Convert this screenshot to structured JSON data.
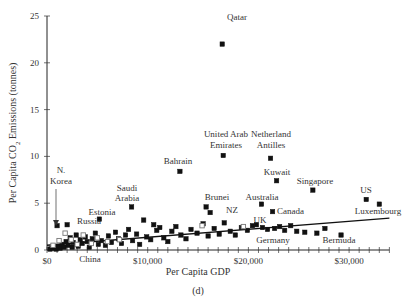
{
  "chart_data": {
    "type": "scatter",
    "title": "",
    "caption": "(d)",
    "xlabel": "Per Capita GDP",
    "ylabel": "Per Capita CO2 Emissions (tonnes)",
    "xlim": [
      0,
      34000
    ],
    "ylim": [
      0,
      25
    ],
    "x_ticks": [
      {
        "value": 0,
        "label": "$0"
      },
      {
        "value": 10000,
        "label": "$10,000"
      },
      {
        "value": 20000,
        "label": "$20,000"
      },
      {
        "value": 30000,
        "label": "$30,000"
      }
    ],
    "y_ticks": [
      {
        "value": 0,
        "label": "0"
      },
      {
        "value": 5,
        "label": "5"
      },
      {
        "value": 10,
        "label": "10"
      },
      {
        "value": 15,
        "label": "15"
      },
      {
        "value": 20,
        "label": "20"
      },
      {
        "value": 25,
        "label": "25"
      }
    ],
    "grid": false,
    "trendline": {
      "x0": 0,
      "y0": 0.5,
      "x1": 34000,
      "y1": 3.4
    },
    "labeled_points": [
      {
        "name": "Qatar",
        "x": 17400,
        "y": 22.0
      },
      {
        "name": "United Arab Emirates",
        "x": 17500,
        "y": 10.1
      },
      {
        "name": "Netherland Antilles",
        "x": 22200,
        "y": 9.8
      },
      {
        "name": "Bahrain",
        "x": 13200,
        "y": 8.4
      },
      {
        "name": "Kuwait",
        "x": 22800,
        "y": 7.4
      },
      {
        "name": "Singapore",
        "x": 26400,
        "y": 6.4
      },
      {
        "name": "US",
        "x": 31700,
        "y": 5.4
      },
      {
        "name": "Luxembourg",
        "x": 33000,
        "y": 4.9
      },
      {
        "name": "Saudi Arabia",
        "x": 8400,
        "y": 4.6
      },
      {
        "name": "Australia",
        "x": 21300,
        "y": 4.9
      },
      {
        "name": "Brunei",
        "x": 15800,
        "y": 4.6
      },
      {
        "name": "NZ",
        "x": 16200,
        "y": 4.0
      },
      {
        "name": "Canada",
        "x": 22400,
        "y": 4.1
      },
      {
        "name": "UK",
        "x": 20400,
        "y": 2.6
      },
      {
        "name": "Germany",
        "x": 22600,
        "y": 2.3
      },
      {
        "name": "Bermuda",
        "x": 29200,
        "y": 1.6
      },
      {
        "name": "Estonia",
        "x": 5200,
        "y": 3.3
      },
      {
        "name": "Russia",
        "x": 2000,
        "y": 2.7
      },
      {
        "name": "N. Korea",
        "x": 1000,
        "y": 2.6
      },
      {
        "name": "China",
        "x": 2500,
        "y": 0.3
      }
    ],
    "other_points": [
      [
        300,
        0.1
      ],
      [
        500,
        0.2
      ],
      [
        700,
        0.3
      ],
      [
        900,
        0.1
      ],
      [
        1100,
        0.4
      ],
      [
        1300,
        0.2
      ],
      [
        1500,
        0.6
      ],
      [
        1700,
        0.3
      ],
      [
        1900,
        0.9
      ],
      [
        2100,
        0.5
      ],
      [
        2300,
        1.3
      ],
      [
        2600,
        0.8
      ],
      [
        2900,
        1.6
      ],
      [
        3100,
        0.4
      ],
      [
        3300,
        1.1
      ],
      [
        3500,
        0.7
      ],
      [
        3800,
        1.4
      ],
      [
        4000,
        0.9
      ],
      [
        4200,
        0.3
      ],
      [
        4500,
        1.2
      ],
      [
        4800,
        1.8
      ],
      [
        5100,
        0.6
      ],
      [
        5400,
        1.0
      ],
      [
        5800,
        0.5
      ],
      [
        6100,
        1.5
      ],
      [
        6400,
        0.8
      ],
      [
        6800,
        1.9
      ],
      [
        7100,
        1.2
      ],
      [
        7400,
        0.7
      ],
      [
        7800,
        1.6
      ],
      [
        8100,
        2.2
      ],
      [
        8500,
        1.0
      ],
      [
        8900,
        1.7
      ],
      [
        9200,
        0.6
      ],
      [
        9600,
        3.2
      ],
      [
        9900,
        1.4
      ],
      [
        10300,
        1.1
      ],
      [
        10600,
        2.7
      ],
      [
        10900,
        2.1
      ],
      [
        11200,
        2.4
      ],
      [
        11600,
        1.3
      ],
      [
        12000,
        0.9
      ],
      [
        12400,
        2.0
      ],
      [
        12800,
        2.5
      ],
      [
        13300,
        1.6
      ],
      [
        13800,
        1.2
      ],
      [
        14300,
        2.2
      ],
      [
        14900,
        1.8
      ],
      [
        15500,
        2.8
      ],
      [
        16000,
        1.5
      ],
      [
        16600,
        2.3
      ],
      [
        17100,
        1.7
      ],
      [
        17600,
        2.9
      ],
      [
        18200,
        2.0
      ],
      [
        18700,
        1.6
      ],
      [
        19300,
        2.4
      ],
      [
        19900,
        2.1
      ],
      [
        20800,
        2.7
      ],
      [
        21400,
        2.4
      ],
      [
        21900,
        2.2
      ],
      [
        23100,
        2.5
      ],
      [
        23600,
        2.1
      ],
      [
        24200,
        2.6
      ],
      [
        24800,
        2.0
      ],
      [
        25600,
        1.9
      ],
      [
        26800,
        1.8
      ],
      [
        27600,
        2.3
      ]
    ],
    "open_points": [
      [
        600,
        0.5
      ],
      [
        1200,
        1.0
      ],
      [
        1800,
        1.8
      ],
      [
        2400,
        1.1
      ],
      [
        3000,
        0.6
      ],
      [
        3600,
        1.6
      ],
      [
        4400,
        0.7
      ],
      [
        5000,
        1.3
      ],
      [
        6000,
        0.9
      ],
      [
        7200,
        1.1
      ],
      [
        15400,
        2.6
      ],
      [
        19500,
        2.5
      ]
    ]
  }
}
